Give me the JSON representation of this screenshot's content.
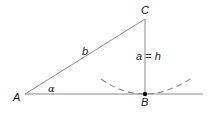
{
  "diagram": {
    "type": "geometry-triangle",
    "vertices": {
      "A": {
        "label": "A",
        "x": 25,
        "y": 94
      },
      "B": {
        "label": "B",
        "x": 145,
        "y": 94
      },
      "C": {
        "label": "C",
        "x": 145,
        "y": 19
      }
    },
    "sides": {
      "b": {
        "label": "b"
      },
      "a": {
        "label": "a = h"
      }
    },
    "angle": {
      "label": "α",
      "vertex": "A"
    },
    "colors": {
      "line": "#8a8a8a",
      "text": "#1a1a1a",
      "point": "#000000"
    }
  }
}
